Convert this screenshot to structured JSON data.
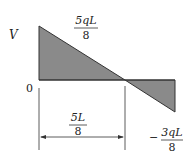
{
  "diagram": {
    "type": "shear-force-diagram",
    "axis_label": "V",
    "origin_label": "0",
    "max_positive": {
      "numerator": "5qL",
      "denominator": "8"
    },
    "max_negative": {
      "sign": "−",
      "numerator": "3qL",
      "denominator": "8"
    },
    "zero_crossing_dimension": {
      "numerator": "5L",
      "denominator": "8"
    },
    "colors": {
      "fill": "#8a8a8a",
      "stroke": "#333333",
      "text": "#222222"
    }
  }
}
